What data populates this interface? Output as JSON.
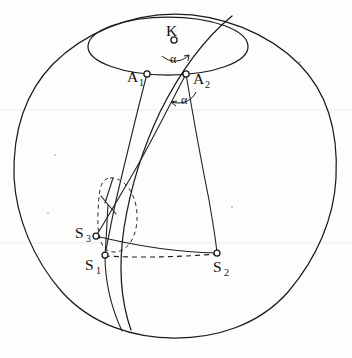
{
  "figure": {
    "type": "geometric-diagram",
    "canvas": {
      "width": 352,
      "height": 358,
      "background": "#fdfdfc"
    },
    "ink_color": "#1b1b1b"
  },
  "labels": {
    "K": {
      "text": "K",
      "sub": "",
      "x": 166,
      "y": 36
    },
    "A1": {
      "text": "A",
      "sub": "1",
      "x": 127,
      "y": 82
    },
    "A2": {
      "text": "A",
      "sub": "2",
      "x": 193,
      "y": 84
    },
    "S1": {
      "text": "S",
      "sub": "1",
      "x": 85,
      "y": 270
    },
    "S2": {
      "text": "S",
      "sub": "2",
      "x": 213,
      "y": 272
    },
    "S3": {
      "text": "S",
      "sub": "3",
      "x": 75,
      "y": 238
    },
    "alpha_K": {
      "text": "α",
      "x": 170,
      "y": 63
    },
    "alpha_A2": {
      "text": "α",
      "x": 181,
      "y": 104
    }
  },
  "points": {
    "K": {
      "x": 174,
      "y": 40
    },
    "A1": {
      "x": 147,
      "y": 74
    },
    "A2": {
      "x": 186,
      "y": 74
    },
    "S1": {
      "x": 105,
      "y": 255
    },
    "S2": {
      "x": 217,
      "y": 253
    },
    "S3": {
      "x": 96,
      "y": 236
    },
    "X": {
      "x": 108,
      "y": 205
    }
  },
  "shapes": {
    "sphere_outline": {
      "cx": 175,
      "cy": 176,
      "r": 162,
      "style": "solid"
    },
    "cap_ellipse": {
      "cx": 168,
      "cy": 46,
      "rx": 80,
      "ry": 29,
      "style": "solid"
    },
    "small_ellipse": {
      "cx": 117,
      "cy": 212,
      "rx": 19,
      "ry": 37,
      "rot": -8,
      "style": "dashed"
    },
    "chord_S1_S2": {
      "style": "dashed"
    },
    "arc_S3_S2": {
      "style": "solid"
    },
    "meridian_A1_S1": {
      "style": "solid"
    },
    "meridian_A2_S2": {
      "style": "solid"
    },
    "meridian_A2_S3": {
      "style": "solid"
    },
    "great_circle": {
      "style": "solid",
      "note": "sweeps from upper-right rim down through lower-left"
    }
  },
  "angle_marks": [
    {
      "at": "K",
      "label": "α",
      "note": "arc between KA1 and KA2 with arrow tip"
    },
    {
      "at": "A2",
      "label": "α",
      "note": "arc below A2 between the two descending meridians, arrow tip"
    }
  ],
  "node_markers": [
    "K",
    "A1",
    "A2",
    "S1",
    "S2",
    "S3"
  ]
}
